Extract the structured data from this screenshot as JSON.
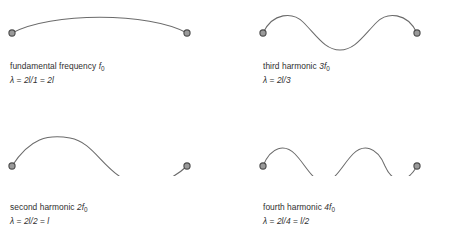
{
  "figure": {
    "title_implied": "Standing wave harmonics on a string of length l",
    "background_color": "#ffffff",
    "curve_color": "#6b6b6b",
    "node_fill_color": "#9a9a9a",
    "node_stroke_color": "#4a4a4a",
    "text_color": "#2f2f2f"
  },
  "panels": [
    {
      "id": "fundamental",
      "position": "top-left",
      "name_label": "fundamental frequency",
      "frequency": "f",
      "frequency_multiplier": "",
      "frequency_subscript": "0",
      "caption_line1": "fundamental frequency f0",
      "wavelength_label": "λ = 2l/1 = 2l",
      "wavelength_lhs": "λ",
      "wavelength_expr_1": "2l/1",
      "wavelength_expr_2": "2l",
      "harmonic_number": 1,
      "half_wavelengths": 1,
      "cycles_drawn": 0.5,
      "start_direction": "up"
    },
    {
      "id": "third-harmonic",
      "position": "top-right",
      "name_label": "third harmonic",
      "frequency": "f",
      "frequency_multiplier": "3",
      "frequency_subscript": "0",
      "caption_line1": "third harmonic 3f0",
      "wavelength_label": "λ = 2l/3",
      "wavelength_lhs": "λ",
      "wavelength_expr_1": "2l/3",
      "wavelength_expr_2": "",
      "harmonic_number": 3,
      "half_wavelengths": 3,
      "cycles_drawn": 1.5,
      "start_direction": "up"
    },
    {
      "id": "second-harmonic",
      "position": "bottom-left",
      "name_label": "second harmonic",
      "frequency": "f",
      "frequency_multiplier": "2",
      "frequency_subscript": "0",
      "caption_line1": "second harmonic 2f0",
      "wavelength_label": "λ = 2l/2 = l",
      "wavelength_lhs": "λ",
      "wavelength_expr_1": "2l/2",
      "wavelength_expr_2": "l",
      "harmonic_number": 2,
      "half_wavelengths": 2,
      "cycles_drawn": 1.0,
      "start_direction": "up"
    },
    {
      "id": "fourth-harmonic",
      "position": "bottom-right",
      "name_label": "fourth harmonic",
      "frequency": "f",
      "frequency_multiplier": "4",
      "frequency_subscript": "0",
      "caption_line1": "fourth harmonic 4f0",
      "wavelength_label": "λ = 2l/4 = l/2",
      "wavelength_lhs": "λ",
      "wavelength_expr_1": "2l/4",
      "wavelength_expr_2": "l/2",
      "harmonic_number": 4,
      "half_wavelengths": 4,
      "cycles_drawn": 2.0,
      "start_direction": "up"
    }
  ]
}
